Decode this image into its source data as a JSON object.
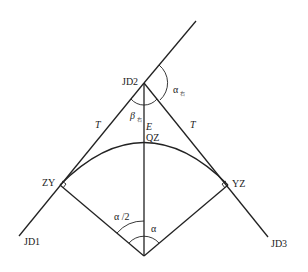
{
  "diagram": {
    "points": {
      "jd1": "JD1",
      "jd2": "JD2",
      "jd3": "JD3",
      "zy": "ZY",
      "yz": "YZ",
      "qz": "QZ"
    },
    "labels": {
      "tangent_left": "T",
      "tangent_right": "T",
      "external": "E",
      "alpha_right": "α",
      "alpha_right_sub": "右",
      "beta_right": "β",
      "beta_right_sub": "右",
      "half_alpha": "α /2",
      "alpha": "α"
    },
    "colors": {
      "line": "#222222",
      "background": "#ffffff"
    }
  }
}
